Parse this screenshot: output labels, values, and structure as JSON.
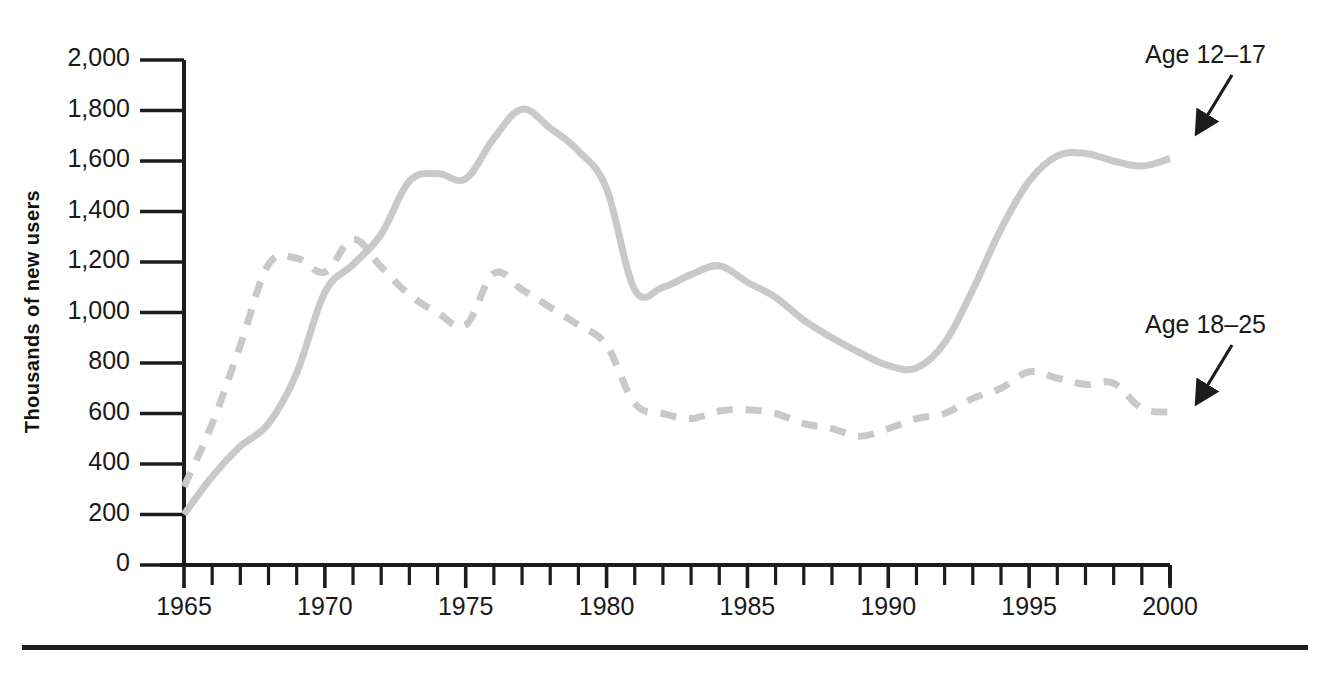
{
  "chart_data": {
    "type": "line",
    "title": "",
    "subtitle": "",
    "xlabel": "",
    "ylabel": "Thousands of new users",
    "xlim": [
      1965,
      2000
    ],
    "ylim": [
      0,
      2000
    ],
    "grid": false,
    "legend_position": "inline-annotations",
    "ytick_labels": [
      "0",
      "200",
      "400",
      "600",
      "800",
      "1,000",
      "1,200",
      "1,400",
      "1,600",
      "1,800",
      "2,000"
    ],
    "ytick_values": [
      0,
      200,
      400,
      600,
      800,
      1000,
      1200,
      1400,
      1600,
      1800,
      2000
    ],
    "xtick_labels": [
      "1965",
      "1970",
      "1975",
      "1980",
      "1985",
      "1990",
      "1995",
      "2000"
    ],
    "xtick_values": [
      1965,
      1970,
      1975,
      1980,
      1985,
      1990,
      1995,
      2000
    ],
    "x_minor_tick_step": 1,
    "x": [
      1965,
      1966,
      1967,
      1968,
      1969,
      1970,
      1971,
      1972,
      1973,
      1974,
      1975,
      1976,
      1977,
      1978,
      1979,
      1980,
      1981,
      1982,
      1983,
      1984,
      1985,
      1986,
      1987,
      1988,
      1989,
      1990,
      1991,
      1992,
      1993,
      1994,
      1995,
      1996,
      1997,
      1998,
      1999,
      2000
    ],
    "series": [
      {
        "name": "Age 12-17",
        "style": "solid",
        "color": "#c9c9c9",
        "values": [
          200,
          350,
          470,
          560,
          760,
          1080,
          1190,
          1310,
          1520,
          1550,
          1530,
          1690,
          1805,
          1730,
          1640,
          1490,
          1090,
          1100,
          1150,
          1185,
          1120,
          1060,
          970,
          900,
          840,
          790,
          780,
          880,
          1090,
          1330,
          1520,
          1620,
          1630,
          1600,
          1580,
          1610
        ]
      },
      {
        "name": "Age 18-25",
        "style": "dashed",
        "color": "#c9c9c9",
        "values": [
          310,
          560,
          870,
          1190,
          1215,
          1160,
          1290,
          1180,
          1070,
          1000,
          950,
          1155,
          1090,
          1020,
          950,
          870,
          640,
          600,
          580,
          610,
          615,
          600,
          560,
          540,
          510,
          540,
          580,
          600,
          660,
          700,
          765,
          740,
          715,
          720,
          620,
          605
        ]
      }
    ],
    "annotations": [
      {
        "text": "Age 12–17",
        "points_to_series": "Age 12-17"
      },
      {
        "text": "Age 18–25",
        "points_to_series": "Age 18-25"
      }
    ]
  }
}
